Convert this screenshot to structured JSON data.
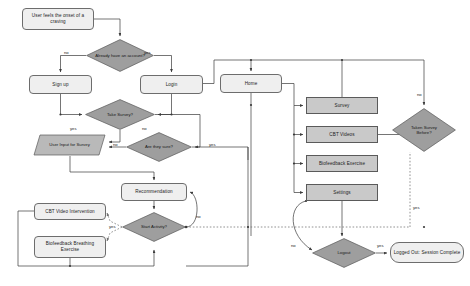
{
  "diagram": {
    "type": "flowchart",
    "colors": {
      "process_fill": "#e8e8e8",
      "decision_fill": "#9e9e9e",
      "menu_fill": "#c9c9c9",
      "input_fill": "#b9b9b9",
      "stroke": "#5a5a5a",
      "text": "#1d1d1d"
    },
    "nodes": [
      {
        "id": "start",
        "label": "User feels the onset of a craving",
        "shape": "rounded-rect",
        "x": 22,
        "y": 8,
        "w": 72,
        "h": 22
      },
      {
        "id": "have_account",
        "label": "Already have an account?",
        "shape": "diamond",
        "x": 86,
        "y": 39,
        "w": 68,
        "h": 33
      },
      {
        "id": "signup",
        "label": "Sign up",
        "shape": "rounded-rect",
        "x": 29,
        "y": 75,
        "w": 63,
        "h": 19
      },
      {
        "id": "login",
        "label": "Login",
        "shape": "rounded-rect",
        "x": 140,
        "y": 75,
        "w": 63,
        "h": 19
      },
      {
        "id": "take_survey",
        "label": "Take Survey?",
        "shape": "diamond",
        "x": 85,
        "y": 99,
        "w": 70,
        "h": 31
      },
      {
        "id": "user_input",
        "label": "User Input for Survey",
        "shape": "parallelogram",
        "x": 33,
        "y": 134,
        "w": 73,
        "h": 22
      },
      {
        "id": "are_sure",
        "label": "Are they sure?",
        "shape": "diamond",
        "x": 126,
        "y": 132,
        "w": 66,
        "h": 30
      },
      {
        "id": "recommend",
        "label": "Recommendation",
        "shape": "rounded-rect",
        "x": 121,
        "y": 183,
        "w": 66,
        "h": 18
      },
      {
        "id": "start_act",
        "label": "Start Activity?",
        "shape": "diamond",
        "x": 122,
        "y": 212,
        "w": 64,
        "h": 30
      },
      {
        "id": "cbt_interv",
        "label": "CBT Video Intervention",
        "shape": "rounded-rect",
        "x": 34,
        "y": 203,
        "w": 72,
        "h": 17
      },
      {
        "id": "biofeed_brth",
        "label": "Biofeedback Breathing Exercise",
        "shape": "rounded-rect",
        "x": 34,
        "y": 236,
        "w": 72,
        "h": 22
      },
      {
        "id": "home",
        "label": "Home",
        "shape": "rounded-rect",
        "x": 220,
        "y": 74,
        "w": 62,
        "h": 19
      },
      {
        "id": "m_survey",
        "label": "Survey",
        "shape": "rect",
        "x": 306,
        "y": 97,
        "w": 72,
        "h": 17
      },
      {
        "id": "m_cbt",
        "label": "CBT Videos",
        "shape": "rect",
        "x": 306,
        "y": 126,
        "w": 72,
        "h": 17
      },
      {
        "id": "m_bio",
        "label": "Biofeedback Exercise",
        "shape": "rect",
        "x": 306,
        "y": 155,
        "w": 72,
        "h": 17
      },
      {
        "id": "m_settings",
        "label": "Settings",
        "shape": "rect",
        "x": 306,
        "y": 184,
        "w": 72,
        "h": 17
      },
      {
        "id": "taken_before",
        "label": "Taken Survey Before?",
        "shape": "diamond",
        "x": 392,
        "y": 108,
        "w": 64,
        "h": 44
      },
      {
        "id": "logout",
        "label": "Logout",
        "shape": "diamond",
        "x": 312,
        "y": 238,
        "w": 64,
        "h": 30
      },
      {
        "id": "logged_out",
        "label": "Logged Out: Session Complete",
        "shape": "rounded-rect",
        "x": 390,
        "y": 242,
        "w": 74,
        "h": 21
      }
    ],
    "edge_labels": [
      {
        "id": "lbl_no_account",
        "text": "no",
        "x": 64,
        "y": 50
      },
      {
        "id": "lbl_yes_account",
        "text": "yes",
        "x": 144,
        "y": 50
      },
      {
        "id": "lbl_yes_survey",
        "text": "yes",
        "x": 70,
        "y": 127
      },
      {
        "id": "lbl_no_survey",
        "text": "no",
        "x": 142,
        "y": 127
      },
      {
        "id": "lbl_no_sure",
        "text": "no",
        "x": 113,
        "y": 144
      },
      {
        "id": "lbl_yes_sure",
        "text": "yes",
        "x": 209,
        "y": 144
      },
      {
        "id": "lbl_no_start",
        "text": "no",
        "x": 196,
        "y": 216
      },
      {
        "id": "lbl_yes_start",
        "text": "yes",
        "x": 110,
        "y": 225
      },
      {
        "id": "lbl_no_taken",
        "text": "no",
        "x": 421,
        "y": 94
      },
      {
        "id": "lbl_yes_taken",
        "text": "yes",
        "x": 421,
        "y": 208
      },
      {
        "id": "lbl_no_logout",
        "text": "no",
        "x": 293,
        "y": 245
      },
      {
        "id": "lbl_yes_logout",
        "text": "yes",
        "x": 378,
        "y": 245
      }
    ]
  }
}
